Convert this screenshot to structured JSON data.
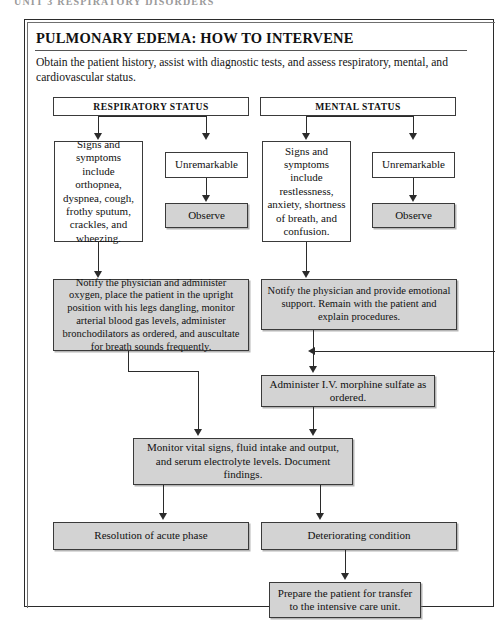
{
  "page_header": "UNIT 3   RESPIRATORY DISORDERS",
  "panel": {
    "title": "PULMONARY EDEMA: HOW TO INTERVENE",
    "intro": "Obtain the patient history, assist with diagnostic tests, and assess respiratory, mental, and cardiovascular status."
  },
  "flow": {
    "respiratory_header": "RESPIRATORY STATUS",
    "mental_header": "MENTAL STATUS",
    "respiratory_signs": "Signs and symptoms include orthopnea, dyspnea, cough, frothy sputum, crackles, and wheezing.",
    "respiratory_unremarkable": "Unremarkable",
    "respiratory_observe": "Observe",
    "mental_signs": "Signs and symptoms include restlessness, anxiety, shortness of breath, and confusion.",
    "mental_unremarkable": "Unremarkable",
    "mental_observe": "Observe",
    "respiratory_intervention": "Notify the physician and administer oxygen, place the patient in the upright position with his legs dangling, monitor arterial blood gas levels, administer bronchodilators as ordered, and auscultate for breath sounds frequently.",
    "mental_intervention": "Notify the physician and provide emotional support. Remain with the patient and explain procedures.",
    "morphine": "Administer I.V. morphine sulfate as ordered.",
    "monitor": "Monitor vital signs, fluid intake and output, and serum electrolyte levels. Document findings.",
    "outcome_resolution": "Resolution of acute phase",
    "outcome_deteriorating": "Deteriorating condition",
    "icu_transfer": "Prepare the patient for transfer to the intensive care unit."
  },
  "colors": {
    "box_fill_gray": "#d3d3d3",
    "box_fill_white": "#ffffff",
    "line": "#2b2b2b"
  }
}
